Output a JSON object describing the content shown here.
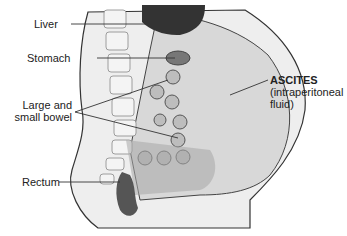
{
  "labels": {
    "liver": "Liver",
    "stomach": "Stomach",
    "bowel_line1": "Large and",
    "bowel_line2": "small bowel",
    "rectum": "Rectum",
    "ascites_title": "ASCITES",
    "ascites_line2": "(intraperitoneal",
    "ascites_line3": "fluid)"
  },
  "colors": {
    "fluid": "#dcdcdc",
    "organ_dark": "#555555",
    "line": "#333333"
  }
}
